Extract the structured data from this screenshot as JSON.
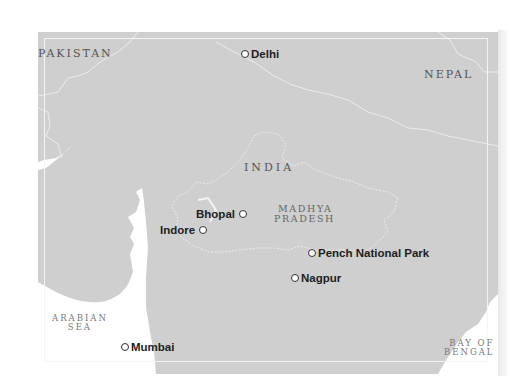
{
  "map": {
    "title": "Central India - Madhya Pradesh",
    "colors": {
      "land": "#cfcfcf",
      "sea": "#ffffff",
      "border_line": "#ececec",
      "label_text": "#555555",
      "city_text": "#1e1e1e"
    },
    "countries": [
      {
        "name": "PAKISTAN"
      },
      {
        "name": "NEPAL"
      },
      {
        "name": "INDIA"
      }
    ],
    "region": {
      "line1": "MADHYA",
      "line2": "PRADESH"
    },
    "seas": [
      {
        "line1": "ARABIAN",
        "line2": "SEA"
      },
      {
        "line1": "BAY OF",
        "line2": "BENGAL"
      }
    ],
    "cities": [
      {
        "name": "Delhi",
        "marker": "circle-marker"
      },
      {
        "name": "Bhopal",
        "marker": "circle-marker"
      },
      {
        "name": "Indore",
        "marker": "circle-marker"
      },
      {
        "name": "Pench National Park",
        "marker": "circle-marker"
      },
      {
        "name": "Nagpur",
        "marker": "circle-marker"
      },
      {
        "name": "Mumbai",
        "marker": "circle-marker"
      }
    ]
  }
}
